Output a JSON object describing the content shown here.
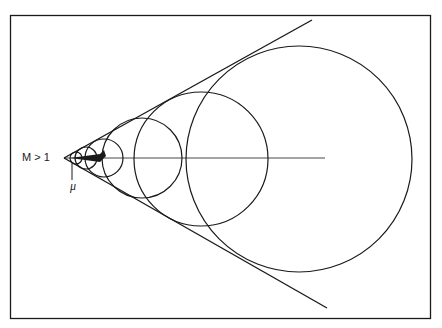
{
  "diagram": {
    "title_label": "M > 1",
    "angle_label": "μ",
    "colors": {
      "stroke": "#1a1a1a",
      "background": "#ffffff"
    },
    "apex": [
      64,
      158
    ],
    "axis_end": [
      325,
      158
    ],
    "tangent_upper_end": [
      312,
      20
    ],
    "tangent_lower_end": [
      327,
      308
    ],
    "circles": [
      {
        "cx": 299,
        "cy": 159,
        "r": 113
      },
      {
        "cx": 201,
        "cy": 159,
        "r": 67
      },
      {
        "cx": 142,
        "cy": 158,
        "r": 40
      },
      {
        "cx": 104,
        "cy": 158,
        "r": 19
      },
      {
        "cx": 86,
        "cy": 158,
        "r": 11
      },
      {
        "cx": 76,
        "cy": 158,
        "r": 6
      }
    ]
  }
}
